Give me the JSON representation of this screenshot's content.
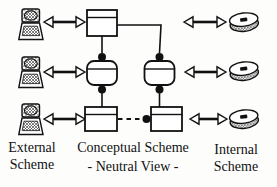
{
  "figure": {
    "external": {
      "label_lines": [
        "External",
        "Scheme"
      ],
      "icon": "terminal-icon",
      "device_count": 3
    },
    "conceptual": {
      "label": "Conceptual Scheme",
      "sublabel": "- Neutral View -"
    },
    "internal": {
      "label_lines": [
        "Internal",
        "Scheme"
      ],
      "icon": "disk-icon",
      "device_count": 3
    },
    "colors": {
      "ink": "#111111",
      "background": "#fdfdfc"
    }
  }
}
